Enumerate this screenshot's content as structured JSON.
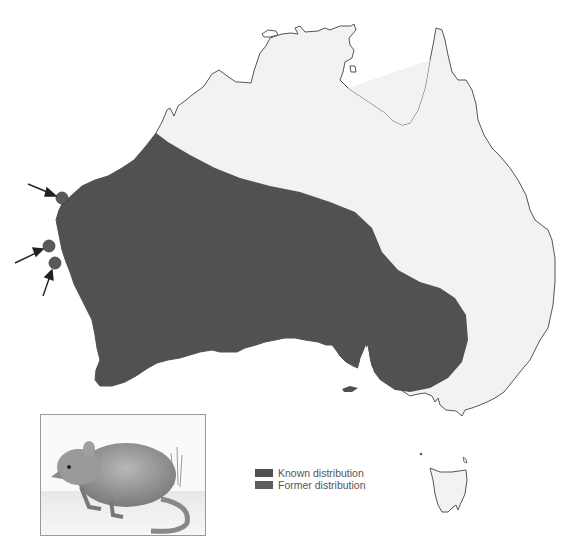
{
  "map": {
    "region": "Australia",
    "colors": {
      "known_distribution": "#4f4f4f",
      "former_distribution": "#585858",
      "land": "#f2f2f2",
      "coastline": "#555555",
      "record_dot": "#5a5a5a"
    },
    "markers": [
      {
        "name": "record-site-1",
        "x": 62,
        "y": 198
      },
      {
        "name": "record-site-2",
        "x": 49,
        "y": 246
      },
      {
        "name": "record-site-3",
        "x": 55,
        "y": 263
      }
    ]
  },
  "legend": {
    "items": [
      {
        "label": "Known distribution",
        "color": "#4f4f4f"
      },
      {
        "label": "Former distribution",
        "color": "#595959"
      }
    ]
  },
  "inset": {
    "subject": "small marsupial illustration"
  }
}
